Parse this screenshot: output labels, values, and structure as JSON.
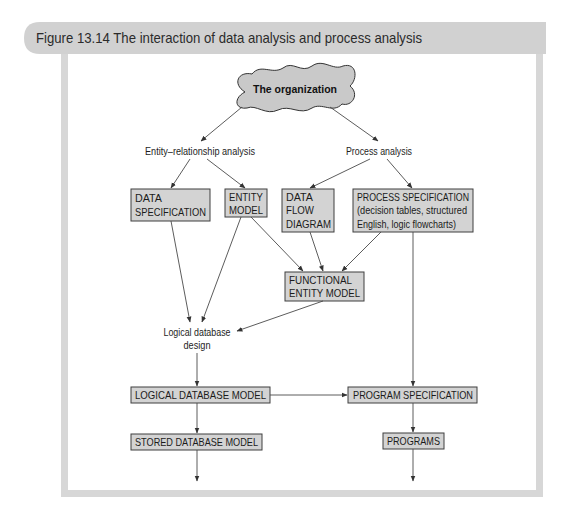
{
  "figure": {
    "title": "Figure 13.14 The interaction of data analysis and process analysis"
  },
  "diagram": {
    "cloud": {
      "label": "The organization"
    },
    "labels": {
      "er_analysis": "Entity–relationship analysis",
      "process_analysis": "Process analysis",
      "logical_db_design": [
        "Logical database",
        "design"
      ]
    },
    "boxes": {
      "data_specification": [
        "DATA",
        "SPECIFICATION"
      ],
      "entity_model": [
        "ENTITY",
        "MODEL"
      ],
      "data_flow_diagram": [
        "DATA",
        "FLOW",
        "DIAGRAM"
      ],
      "process_specification": [
        "PROCESS SPECIFICATION",
        "(decision tables, structured",
        "English, logic flowcharts)"
      ],
      "functional_entity_model": [
        "FUNCTIONAL",
        "ENTITY MODEL"
      ],
      "logical_database_model": [
        "LOGICAL DATABASE MODEL"
      ],
      "program_specification": [
        "PROGRAM SPECIFICATION"
      ],
      "stored_database_model": [
        "STORED DATABASE MODEL"
      ],
      "programs": [
        "PROGRAMS"
      ]
    },
    "edges": [
      {
        "from": "The organization",
        "to": "Entity–relationship analysis"
      },
      {
        "from": "The organization",
        "to": "Process analysis"
      },
      {
        "from": "Entity–relationship analysis",
        "to": "DATA SPECIFICATION"
      },
      {
        "from": "Entity–relationship analysis",
        "to": "ENTITY MODEL"
      },
      {
        "from": "Process analysis",
        "to": "DATA FLOW DIAGRAM"
      },
      {
        "from": "Process analysis",
        "to": "PROCESS SPECIFICATION"
      },
      {
        "from": "DATA SPECIFICATION",
        "to": "Logical database design"
      },
      {
        "from": "ENTITY MODEL",
        "to": "Logical database design"
      },
      {
        "from": "ENTITY MODEL",
        "to": "FUNCTIONAL ENTITY MODEL"
      },
      {
        "from": "DATA FLOW DIAGRAM",
        "to": "FUNCTIONAL ENTITY MODEL"
      },
      {
        "from": "PROCESS SPECIFICATION",
        "to": "FUNCTIONAL ENTITY MODEL"
      },
      {
        "from": "FUNCTIONAL ENTITY MODEL",
        "to": "Logical database design"
      },
      {
        "from": "PROCESS SPECIFICATION",
        "to": "PROGRAM SPECIFICATION"
      },
      {
        "from": "Logical database design",
        "to": "LOGICAL DATABASE MODEL"
      },
      {
        "from": "LOGICAL DATABASE MODEL",
        "to": "PROGRAM SPECIFICATION"
      },
      {
        "from": "LOGICAL DATABASE MODEL",
        "to": "STORED DATABASE MODEL"
      },
      {
        "from": "PROGRAM SPECIFICATION",
        "to": "PROGRAMS"
      },
      {
        "from": "STORED DATABASE MODEL",
        "to": "(continues)"
      },
      {
        "from": "PROGRAMS",
        "to": "(continues)"
      }
    ]
  },
  "colors": {
    "header_bg": "#d1d1d1",
    "frame": "#d7d7d7",
    "box_fill": "#d3d3d3",
    "cloud_fill": "#c9c9c9",
    "ink": "#2b2b2b",
    "line": "#4a4a4a"
  }
}
